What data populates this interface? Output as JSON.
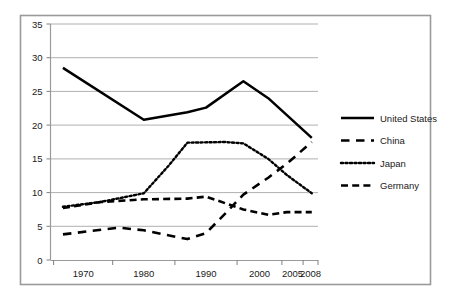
{
  "chart_data": {
    "type": "line",
    "title": "",
    "subtitle": "",
    "xlabel": "",
    "ylabel": "",
    "grid": true,
    "grid_axis": "y",
    "legend_position": "right",
    "ylim": [
      0,
      35
    ],
    "ytick_step": 5,
    "yticks": [
      "0",
      "5",
      "10",
      "15",
      "20",
      "25",
      "30",
      "35"
    ],
    "xticks": [
      "1970",
      "1980",
      "1990",
      "2000",
      "2005",
      "2008"
    ],
    "xtick_values": [
      1970,
      1980,
      1990,
      2000,
      2005,
      2008
    ],
    "xlim": [
      1965,
      2008
    ],
    "series": [
      {
        "name": "United States",
        "style": "solid",
        "color": "#000000",
        "x": [
          1967,
          1980,
          1987,
          1990,
          1996,
          2000,
          2007
        ],
        "values": [
          28.5,
          20.8,
          21.9,
          22.6,
          26.5,
          24.0,
          18.1
        ]
      },
      {
        "name": "China",
        "style": "long-dash",
        "color": "#000000",
        "x": [
          1967,
          1976,
          1980,
          1987,
          1990,
          1993,
          1996,
          2000,
          2003,
          2007
        ],
        "values": [
          3.8,
          4.8,
          4.4,
          3.1,
          4.0,
          6.8,
          9.7,
          12.2,
          14.3,
          17.5
        ]
      },
      {
        "name": "Japan",
        "style": "dotted",
        "color": "#000000",
        "x": [
          1967,
          1973,
          1980,
          1984,
          1987,
          1993,
          1996,
          2000,
          2003,
          2007
        ],
        "values": [
          7.9,
          8.6,
          9.9,
          14.0,
          17.4,
          17.5,
          17.3,
          15.0,
          12.6,
          9.9
        ]
      },
      {
        "name": "Germany",
        "style": "dash",
        "color": "#000000",
        "x": [
          1967,
          1973,
          1980,
          1987,
          1990,
          1996,
          2000,
          2003,
          2007
        ],
        "values": [
          7.7,
          8.6,
          9.0,
          9.1,
          9.4,
          7.5,
          6.7,
          7.1,
          7.1
        ]
      }
    ],
    "legend_entries": [
      {
        "label": "United States",
        "style": "solid"
      },
      {
        "label": "China",
        "style": "long-dash"
      },
      {
        "label": "Japan",
        "style": "dotted"
      },
      {
        "label": "Germany",
        "style": "dash"
      }
    ]
  },
  "axes": {
    "ytick_0": "0",
    "ytick_1": "5",
    "ytick_2": "10",
    "ytick_3": "15",
    "ytick_4": "20",
    "ytick_5": "25",
    "ytick_6": "30",
    "ytick_7": "35",
    "xtick_0": "1970",
    "xtick_1": "1980",
    "xtick_2": "1990",
    "xtick_3": "2000",
    "xtick_4": "2005",
    "xtick_5": "2008"
  },
  "legend": {
    "item_0": "United States",
    "item_1": "China",
    "item_2": "Japan",
    "item_3": "Germany"
  },
  "colors": {
    "line": "#000000",
    "grid": "#b0b0b0",
    "axis": "#808080",
    "frame": "#9a9a9a",
    "text": "#1a1a1a",
    "background": "#ffffff"
  }
}
